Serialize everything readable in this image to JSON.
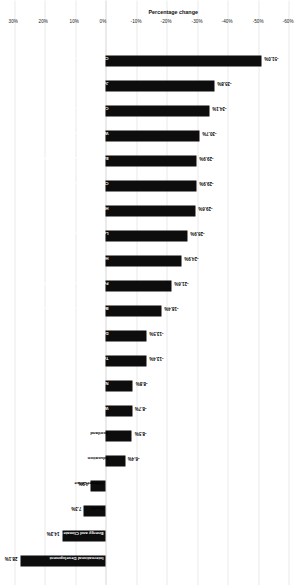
{
  "chart_data": {
    "type": "bar",
    "title": "",
    "subtitle": "",
    "xlabel": "",
    "ylabel": "Percentage change",
    "orientation": "vertical-rotated",
    "grid": true,
    "legend": "none",
    "ylim": [
      -60,
      30
    ],
    "yticks": [
      30,
      20,
      10,
      0,
      -10,
      -20,
      -30,
      -40,
      -50,
      -60
    ],
    "ytick_labels": [
      "30%",
      "20%",
      "10%",
      "0%",
      "-10%",
      "-20%",
      "-30%",
      "-40%",
      "-50%",
      "-60%"
    ],
    "bar_color": "#0d0d0d",
    "categories": [
      "International Development",
      "Energy and Climate Change",
      "Health",
      "Cabinet Office",
      "Education",
      "Scotland",
      "Wales",
      "N. Ireland",
      "Transport",
      "Defence",
      "Business, Innovation and Skills",
      "Foreign and Commonwealth Office",
      "Home Office",
      "Law Officers' Department",
      "HM Treasury",
      "CLG Communities",
      "Environment, Food and Rural Affairs",
      "Work and Pensions",
      "Culture, Media and Sport",
      "Justice",
      "CLG Local Government"
    ],
    "values": [
      28.1,
      14.3,
      7.3,
      4.9,
      -6.4,
      -8.5,
      -8.7,
      -8.8,
      -13.4,
      -13.5,
      -18.4,
      -21.6,
      -24.9,
      -26.9,
      -29.6,
      -29.9,
      -29.9,
      -30.7,
      -34.1,
      -35.8,
      -51.0
    ],
    "value_labels": [
      "28.1%",
      "14.3%",
      "7.3%",
      "4.9%",
      "-6.4%",
      "-8.5%",
      "-8.7%",
      "-8.8%",
      "-13.4%",
      "-13.5%",
      "-18.4%",
      "-21.6%",
      "-24.9%",
      "-26.9%",
      "-29.6%",
      "-29.9%",
      "-29.9%",
      "-30.7%",
      "-34.1%",
      "-35.8%",
      "-51.0%"
    ]
  }
}
